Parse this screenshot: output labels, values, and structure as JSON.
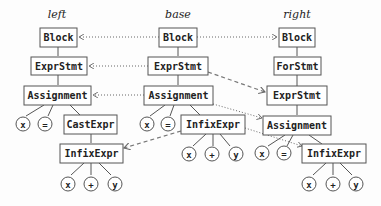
{
  "labels": {
    "left": "left",
    "base": "base",
    "right": "right"
  },
  "nodes": {
    "left_block": "Block",
    "left_exprstmt": "ExprStmt",
    "left_assignment": "Assignment",
    "left_x": "x",
    "left_eq": "=",
    "left_castexpr": "CastExpr",
    "left_infixexpr": "InfixExpr",
    "left_infix_x": "x",
    "left_infix_plus": "+",
    "left_infix_y": "y",
    "base_block": "Block",
    "base_exprstmt": "ExprStmt",
    "base_assignment": "Assignment",
    "base_x": "x",
    "base_eq": "=",
    "base_infixexpr": "InfixExpr",
    "base_infix_x": "x",
    "base_infix_plus": "+",
    "base_infix_y": "y",
    "right_block": "Block",
    "right_forstmt": "ForStmt",
    "right_exprstmt": "ExprStmt",
    "right_assignment": "Assignment",
    "right_x": "x",
    "right_eq": "=",
    "right_infixexpr": "InfixExpr",
    "right_infix_x": "x",
    "right_infix_plus": "+",
    "right_infix_y": "y"
  },
  "mappings": [
    {
      "from": "base.Block",
      "to": "left.Block",
      "style": "dotted"
    },
    {
      "from": "base.Block",
      "to": "right.Block",
      "style": "dotted"
    },
    {
      "from": "base.ExprStmt",
      "to": "left.ExprStmt",
      "style": "dotted"
    },
    {
      "from": "base.ExprStmt",
      "to": "right.ExprStmt",
      "style": "dashed"
    },
    {
      "from": "base.Assignment",
      "to": "left.Assignment",
      "style": "dotted"
    },
    {
      "from": "base.Assignment",
      "to": "right.Assignment",
      "style": "dotted"
    },
    {
      "from": "base.InfixExpr",
      "to": "left.InfixExpr",
      "style": "dashed"
    },
    {
      "from": "base.InfixExpr",
      "to": "right.InfixExpr",
      "style": "dotted"
    }
  ],
  "colors": {
    "stroke": "#555555",
    "text": "#222222",
    "background": "#fdfdfd"
  }
}
